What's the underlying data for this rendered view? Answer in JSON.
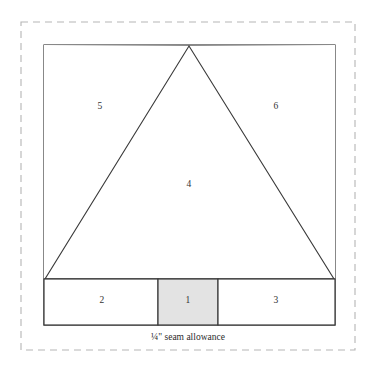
{
  "diagram": {
    "canvas": {
      "width": 371,
      "height": 370,
      "background": "#ffffff"
    },
    "colors": {
      "line": "#3a3a3a",
      "dashed_border": "#b5b5b5",
      "shaded_fill": "#e3e3e3",
      "white_fill": "#ffffff",
      "label_text": "#333333",
      "caption_text": "#2b2b2b"
    },
    "seam_allowance_border": {
      "label": "dashed seam allowance boundary",
      "x": 21,
      "y": 22,
      "width": 334,
      "height": 328,
      "style": "dashed",
      "color": "#b5b5b5"
    },
    "block_outline": {
      "label": "finished block outline",
      "x": 44,
      "y": 45,
      "width": 291,
      "height": 280,
      "style": "solid",
      "color": "#3a3a3a"
    },
    "base_line": {
      "y": 279,
      "x1": 44,
      "x2": 335
    },
    "triangle": {
      "label": "center triangle piece 4",
      "apex": {
        "x": 189,
        "y": 46
      },
      "base_left": {
        "x": 45,
        "y": 279
      },
      "base_right": {
        "x": 334,
        "y": 279
      },
      "fill": "#ffffff"
    },
    "bottom_row": {
      "top": 279,
      "bottom": 325,
      "dividers": [
        158,
        218
      ],
      "cells": [
        {
          "number": "2",
          "x": 44,
          "width": 114,
          "fill": "#ffffff",
          "shaded": false
        },
        {
          "number": "1",
          "x": 158,
          "width": 60,
          "fill": "#e3e3e3",
          "shaded": true
        },
        {
          "number": "3",
          "x": 218,
          "width": 117,
          "fill": "#ffffff",
          "shaded": false
        }
      ]
    },
    "piece_labels": [
      {
        "number": "5",
        "x": 100,
        "y": 107,
        "region": "left background triangle"
      },
      {
        "number": "6",
        "x": 276,
        "y": 107,
        "region": "right background triangle"
      },
      {
        "number": "4",
        "x": 189,
        "y": 185,
        "region": "center triangle"
      },
      {
        "number": "2",
        "x": 102,
        "y": 301,
        "region": "bottom left rectangle"
      },
      {
        "number": "1",
        "x": 188,
        "y": 301,
        "region": "bottom center rectangle"
      },
      {
        "number": "3",
        "x": 276,
        "y": 301,
        "region": "bottom right rectangle"
      }
    ],
    "caption": {
      "text": "¼\" seam allowance",
      "x": 188,
      "y": 338
    }
  }
}
